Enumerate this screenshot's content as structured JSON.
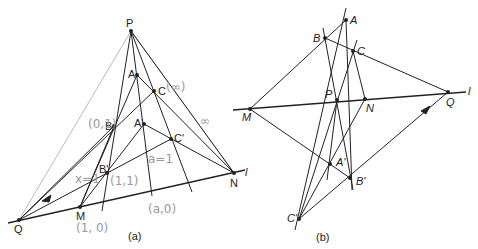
{
  "figure_a": {
    "caption": "(a)",
    "points": {
      "P": "P",
      "A": "A",
      "C": "C",
      "B": "B",
      "A_prime": "A'",
      "C_prime": "C'",
      "B_prime": "B'",
      "N": "N",
      "M": "M",
      "Q": "Q"
    },
    "line_label": "l",
    "annotations": {
      "C_coord": "(∞)",
      "B_coord": "(0,1)",
      "Bp_coord": "(1,1)",
      "M_coord": "(1, 0)",
      "x_label": "x=1",
      "a0_coord": "(a,0)",
      "inf_mark": "∞",
      "a_mark": "a=1"
    }
  },
  "figure_b": {
    "caption": "(b)",
    "points": {
      "A": "A",
      "B": "B",
      "C": "C",
      "P": "P",
      "N": "N",
      "M": "M",
      "Q": "Q",
      "A_prime": "A'",
      "B_prime": "B'",
      "C_prime": "C'"
    },
    "line_label": "l"
  }
}
